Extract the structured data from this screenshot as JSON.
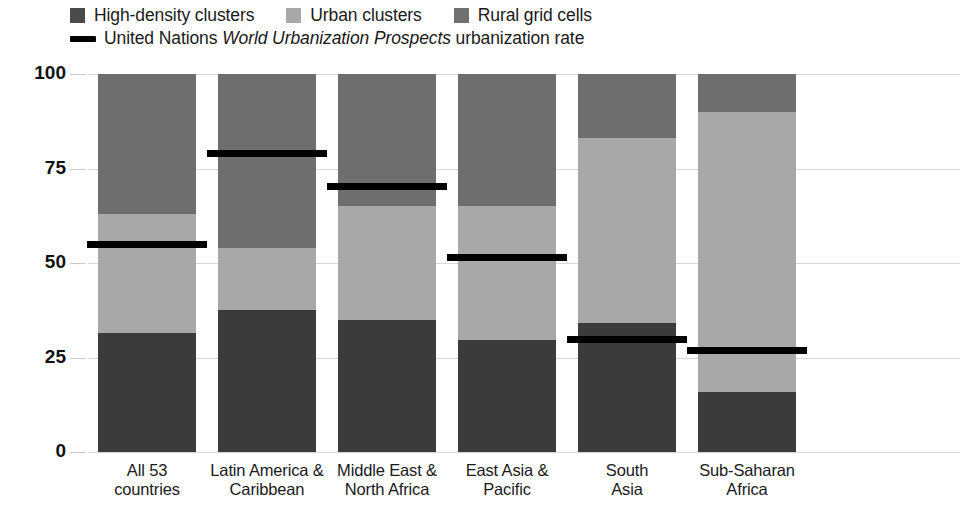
{
  "legend": {
    "items": [
      {
        "name": "high-density-clusters",
        "label": "High-density clusters",
        "color": "#4a4a4a",
        "type": "swatch"
      },
      {
        "name": "urban-clusters",
        "label": "Urban clusters",
        "color": "#a8a8a8",
        "type": "swatch"
      },
      {
        "name": "rural-grid-cells",
        "label": "Rural grid cells",
        "color": "#717171",
        "type": "swatch"
      }
    ],
    "line_entry": {
      "name": "un-urbanization-rate",
      "prefix": "United Nations ",
      "italic": "World Urbanization Prospects",
      "suffix": " urbanization rate",
      "color": "#000000"
    }
  },
  "axis": {
    "ticks": [
      "100",
      "75",
      "50",
      "25",
      "0"
    ],
    "tick_values": [
      100,
      75,
      50,
      25,
      0
    ],
    "min": 0,
    "max": 100
  },
  "chart_data": {
    "type": "bar",
    "stacked": true,
    "title": "",
    "xlabel": "",
    "ylabel": "",
    "ylim": [
      0,
      100
    ],
    "grid": true,
    "legend_position": "top-left",
    "categories": [
      "All 53\ncountries",
      "Latin America &\nCaribbean",
      "Middle East &\nNorth Africa",
      "East Asia &\nPacific",
      "South\nAsia",
      "Sub-Saharan\nAfrica"
    ],
    "category_lines": [
      [
        "All 53",
        "countries"
      ],
      [
        "Latin America &",
        "Caribbean"
      ],
      [
        "Middle East &",
        "North Africa"
      ],
      [
        "East Asia &",
        "Pacific"
      ],
      [
        "South",
        "Asia"
      ],
      [
        "Sub-Saharan",
        "Africa"
      ]
    ],
    "series": [
      {
        "name": "High-density clusters",
        "color": "#3b3b3b",
        "values": [
          31.5,
          37.5,
          35,
          29.5,
          34,
          16
        ]
      },
      {
        "name": "Urban clusters",
        "color": "#a8a8a8",
        "values": [
          31.5,
          16.5,
          30,
          35.5,
          49,
          74
        ]
      },
      {
        "name": "Rural grid cells",
        "color": "#6e6e6e",
        "values": [
          37,
          46,
          35,
          35,
          17,
          10
        ]
      }
    ],
    "overlay": {
      "name": "United Nations World Urbanization Prospects urbanization rate",
      "color": "#000000",
      "values": [
        55,
        79,
        70.5,
        51.5,
        30,
        27
      ]
    }
  }
}
